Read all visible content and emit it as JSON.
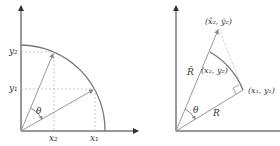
{
  "left_diagram": {
    "labels": {
      "y2": "y₂",
      "y1": "y₁",
      "x2": "x₂",
      "x1": "x₁",
      "theta": "θ"
    }
  },
  "right_diagram": {
    "labels": {
      "hat_point": "(x̂₂, ŷ₂)",
      "p2": "(x₂, y₂)",
      "p1": "(x₁, y₁)",
      "R_hat": "R̂",
      "R": "R",
      "theta": "θ"
    }
  },
  "colors": {
    "axis": "#333333",
    "line": "#888888",
    "dashed": "#bbbbbb",
    "arc": "#777777"
  }
}
